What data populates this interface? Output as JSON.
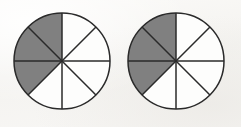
{
  "figure": {
    "kind": "fraction-circles",
    "background_color": "#f7f6f4",
    "stroke_color": "#2a2a2a",
    "shaded_color": "#808080",
    "unshaded_color": "#fdfdfc",
    "stroke_width": 1.5,
    "total_sectors_each": 8,
    "shaded_sectors_each": 3
  },
  "chart_data": {
    "type": "pie",
    "title": "",
    "subtitle": "",
    "xlabel": "",
    "ylabel": "",
    "grid": false,
    "legend": "none",
    "charts": [
      {
        "name": "left-circle",
        "center_x": 62,
        "center_y": 61,
        "radius": 48,
        "slices": 8,
        "slice_degrees": 45,
        "start_angle_deg": 90,
        "direction": "counterclockwise",
        "categories": [
          "sector-1",
          "sector-2",
          "sector-3",
          "sector-4",
          "sector-5",
          "sector-6",
          "sector-7",
          "sector-8"
        ],
        "values": [
          45,
          45,
          45,
          45,
          45,
          45,
          45,
          45
        ],
        "shaded": [
          true,
          true,
          true,
          false,
          false,
          false,
          false,
          false
        ],
        "shaded_count": 3,
        "fraction": "3/8"
      },
      {
        "name": "right-circle",
        "center_x": 176,
        "center_y": 61,
        "radius": 48,
        "slices": 8,
        "slice_degrees": 45,
        "start_angle_deg": 90,
        "direction": "counterclockwise",
        "categories": [
          "sector-1",
          "sector-2",
          "sector-3",
          "sector-4",
          "sector-5",
          "sector-6",
          "sector-7",
          "sector-8"
        ],
        "values": [
          45,
          45,
          45,
          45,
          45,
          45,
          45,
          45
        ],
        "shaded": [
          true,
          true,
          true,
          false,
          false,
          false,
          false,
          false
        ],
        "shaded_count": 3,
        "fraction": "3/8"
      }
    ]
  }
}
